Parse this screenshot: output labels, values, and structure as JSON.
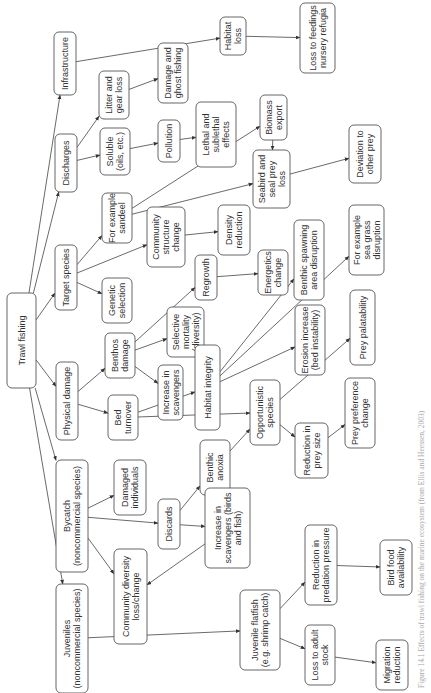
{
  "orientation": "rotated-90-ccw",
  "caption": "Figure 14.1 Effects of trawl fishing on the marine ecosystem (from Ellis and Heessen, 2003)",
  "colors": {
    "stroke": "#555555",
    "text": "#333333",
    "background": "#ffffff"
  },
  "nodes": [
    {
      "id": "trawl",
      "lines": [
        "Trawl fishing"
      ],
      "x": 7,
      "y": 293,
      "w": 29,
      "h": 95
    },
    {
      "id": "infrastructure",
      "lines": [
        "Infrastructure"
      ],
      "x": 54,
      "y": 32,
      "w": 22,
      "h": 63
    },
    {
      "id": "discharges",
      "lines": [
        "Discharges"
      ],
      "x": 55,
      "y": 134,
      "w": 22,
      "h": 58
    },
    {
      "id": "target",
      "lines": [
        "Target species"
      ],
      "x": 55,
      "y": 245,
      "w": 22,
      "h": 65
    },
    {
      "id": "physical",
      "lines": [
        "Physical damage"
      ],
      "x": 56,
      "y": 362,
      "w": 22,
      "h": 78
    },
    {
      "id": "bycatch",
      "lines": [
        "Bycatch",
        "(noncommercial species)"
      ],
      "x": 56,
      "y": 460,
      "w": 32,
      "h": 112
    },
    {
      "id": "juveniles",
      "lines": [
        "Juveniles",
        "(noncommercial species)"
      ],
      "x": 56,
      "y": 584,
      "w": 32,
      "h": 109
    },
    {
      "id": "litter",
      "lines": [
        "Litter and",
        "gear loss"
      ],
      "x": 99,
      "y": 71,
      "w": 30,
      "h": 48
    },
    {
      "id": "soluble",
      "lines": [
        "Soluble",
        "(oils, etc.)"
      ],
      "x": 100,
      "y": 128,
      "w": 30,
      "h": 47
    },
    {
      "id": "sandeel",
      "lines": [
        "For example",
        "sandeel"
      ],
      "x": 102,
      "y": 193,
      "w": 30,
      "h": 50
    },
    {
      "id": "genetic",
      "lines": [
        "Genetic",
        "selection"
      ],
      "x": 102,
      "y": 278,
      "w": 30,
      "h": 45
    },
    {
      "id": "benthos",
      "lines": [
        "Benthos",
        "damage"
      ],
      "x": 105,
      "y": 333,
      "w": 30,
      "h": 45
    },
    {
      "id": "bed",
      "lines": [
        "Bed",
        "turnover"
      ],
      "x": 108,
      "y": 395,
      "w": 30,
      "h": 45
    },
    {
      "id": "damaged",
      "lines": [
        "Damaged",
        "individuals"
      ],
      "x": 114,
      "y": 460,
      "w": 32,
      "h": 55
    },
    {
      "id": "community_div",
      "lines": [
        "Community diversity",
        "loss/change"
      ],
      "x": 114,
      "y": 549,
      "w": 33,
      "h": 95
    },
    {
      "id": "ghost",
      "lines": [
        "Damage and",
        "ghost fishing"
      ],
      "x": 158,
      "y": 43,
      "w": 30,
      "h": 60
    },
    {
      "id": "pollution",
      "lines": [
        "Pollution"
      ],
      "x": 158,
      "y": 120,
      "w": 22,
      "h": 42
    },
    {
      "id": "community_struct",
      "lines": [
        "Community",
        "structure",
        "change"
      ],
      "x": 147,
      "y": 207,
      "w": 38,
      "h": 60
    },
    {
      "id": "selective",
      "lines": [
        "Selective",
        "mortality",
        "(diversity)"
      ],
      "x": 167,
      "y": 307,
      "w": 37,
      "h": 50
    },
    {
      "id": "scavengers",
      "lines": [
        "Increase in",
        "scavengers"
      ],
      "x": 158,
      "y": 365,
      "w": 25,
      "h": 55
    },
    {
      "id": "discards",
      "lines": [
        "Discards"
      ],
      "x": 158,
      "y": 499,
      "w": 22,
      "h": 50
    },
    {
      "id": "lethal",
      "lines": [
        "Lethal and",
        "sublethal",
        "effects"
      ],
      "x": 196,
      "y": 102,
      "w": 40,
      "h": 65
    },
    {
      "id": "regrowth",
      "lines": [
        "Regrowth"
      ],
      "x": 195,
      "y": 255,
      "w": 22,
      "h": 45
    },
    {
      "id": "habitat_int",
      "lines": [
        "Habitat integrity"
      ],
      "x": 195,
      "y": 345,
      "w": 25,
      "h": 85
    },
    {
      "id": "anoxia",
      "lines": [
        "Benthic",
        "anoxia"
      ],
      "x": 200,
      "y": 440,
      "w": 30,
      "h": 55
    },
    {
      "id": "scav_birds",
      "lines": [
        "Increase in",
        "scavengers (birds",
        "and fish)"
      ],
      "x": 205,
      "y": 488,
      "w": 45,
      "h": 80
    },
    {
      "id": "habitat_loss",
      "lines": [
        "Habitat",
        "loss"
      ],
      "x": 220,
      "y": 17,
      "w": 26,
      "h": 38
    },
    {
      "id": "density",
      "lines": [
        "Density",
        "reduction"
      ],
      "x": 218,
      "y": 205,
      "w": 32,
      "h": 50
    },
    {
      "id": "flatfish",
      "lines": [
        "Juvenile flatfish",
        "(e.g. shrimp catch)"
      ],
      "x": 240,
      "y": 590,
      "w": 40,
      "h": 80
    },
    {
      "id": "opportunistic",
      "lines": [
        "Opportunistic",
        "species"
      ],
      "x": 250,
      "y": 380,
      "w": 30,
      "h": 65
    },
    {
      "id": "seabird",
      "lines": [
        "Seabird and",
        "seal prey",
        "loss"
      ],
      "x": 253,
      "y": 150,
      "w": 37,
      "h": 58
    },
    {
      "id": "energetics",
      "lines": [
        "Energetics",
        "change"
      ],
      "x": 258,
      "y": 250,
      "w": 30,
      "h": 45
    },
    {
      "id": "biomass",
      "lines": [
        "Biomass",
        "export"
      ],
      "x": 260,
      "y": 95,
      "w": 27,
      "h": 45
    },
    {
      "id": "spawning",
      "lines": [
        "Benthic spawning",
        "area disruption"
      ],
      "x": 294,
      "y": 220,
      "w": 30,
      "h": 80
    },
    {
      "id": "erosion",
      "lines": [
        "Erosion increase",
        "(bed instability)"
      ],
      "x": 295,
      "y": 305,
      "w": 30,
      "h": 70
    },
    {
      "id": "prey_size",
      "lines": [
        "Reduction in",
        "prey size"
      ],
      "x": 295,
      "y": 423,
      "w": 33,
      "h": 55
    },
    {
      "id": "nursery",
      "lines": [
        "Loss to feedings",
        "nursery refugia"
      ],
      "x": 300,
      "y": 3,
      "w": 35,
      "h": 70
    },
    {
      "id": "predation",
      "lines": [
        "Reduction in",
        "predation pressure"
      ],
      "x": 305,
      "y": 525,
      "w": 32,
      "h": 80
    },
    {
      "id": "adult",
      "lines": [
        "Loss to adult",
        "stock"
      ],
      "x": 305,
      "y": 625,
      "w": 30,
      "h": 60
    },
    {
      "id": "deviation",
      "lines": [
        "Deviation to",
        "other prey"
      ],
      "x": 349,
      "y": 125,
      "w": 32,
      "h": 58
    },
    {
      "id": "seagrass",
      "lines": [
        "For example",
        "sea grass",
        "disruption"
      ],
      "x": 349,
      "y": 205,
      "w": 35,
      "h": 70
    },
    {
      "id": "palatability",
      "lines": [
        "Prey palatability"
      ],
      "x": 350,
      "y": 290,
      "w": 25,
      "h": 75
    },
    {
      "id": "preference",
      "lines": [
        "Prey preference",
        "change"
      ],
      "x": 345,
      "y": 378,
      "w": 30,
      "h": 70
    },
    {
      "id": "birdfood",
      "lines": [
        "Bird food",
        "availability"
      ],
      "x": 380,
      "y": 540,
      "w": 32,
      "h": 55
    },
    {
      "id": "migration",
      "lines": [
        "Migration",
        "reduction"
      ],
      "x": 376,
      "y": 640,
      "w": 32,
      "h": 50
    }
  ],
  "edges": [
    [
      "trawl",
      "infrastructure"
    ],
    [
      "trawl",
      "discharges"
    ],
    [
      "trawl",
      "target"
    ],
    [
      "trawl",
      "physical"
    ],
    [
      "trawl",
      "bycatch"
    ],
    [
      "trawl",
      "juveniles"
    ],
    [
      "infrastructure",
      "habitat_loss"
    ],
    [
      "habitat_loss",
      "nursery"
    ],
    [
      "discharges",
      "litter"
    ],
    [
      "discharges",
      "soluble"
    ],
    [
      "litter",
      "ghost"
    ],
    [
      "soluble",
      "pollution"
    ],
    [
      "pollution",
      "lethal"
    ],
    [
      "target",
      "sandeel"
    ],
    [
      "target",
      "genetic"
    ],
    [
      "target",
      "community_struct"
    ],
    [
      "sandeel",
      "biomass"
    ],
    [
      "sandeel",
      "seabird"
    ],
    [
      "biomass",
      "seabird"
    ],
    [
      "seabird",
      "deviation"
    ],
    [
      "community_struct",
      "density"
    ],
    [
      "regrowth",
      "energetics"
    ],
    [
      "physical",
      "benthos"
    ],
    [
      "physical",
      "bed"
    ],
    [
      "benthos",
      "selective"
    ],
    [
      "benthos",
      "scavengers"
    ],
    [
      "benthos",
      "regrowth"
    ],
    [
      "bed",
      "habitat_int"
    ],
    [
      "bed",
      "opportunistic"
    ],
    [
      "habitat_int",
      "spawning"
    ],
    [
      "habitat_int",
      "seagrass"
    ],
    [
      "habitat_int",
      "erosion"
    ],
    [
      "opportunistic",
      "palatability"
    ],
    [
      "opportunistic",
      "prey_size"
    ],
    [
      "prey_size",
      "preference"
    ],
    [
      "bycatch",
      "damaged"
    ],
    [
      "bycatch",
      "discards"
    ],
    [
      "bycatch",
      "community_div"
    ],
    [
      "discards",
      "anoxia"
    ],
    [
      "discards",
      "scav_birds"
    ],
    [
      "scav_birds",
      "community_div"
    ],
    [
      "anoxia",
      "opportunistic"
    ],
    [
      "juveniles",
      "flatfish"
    ],
    [
      "flatfish",
      "predation"
    ],
    [
      "flatfish",
      "adult"
    ],
    [
      "predation",
      "birdfood"
    ],
    [
      "adult",
      "migration"
    ]
  ]
}
